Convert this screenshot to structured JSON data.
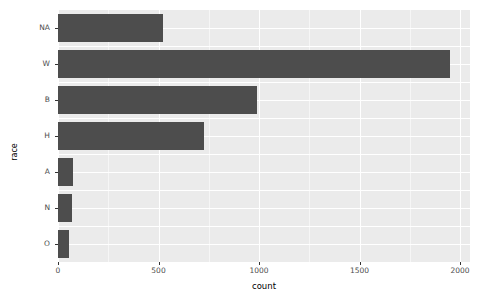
{
  "chart_data": {
    "type": "bar",
    "orientation": "horizontal",
    "title": "",
    "xlabel": "count",
    "ylabel": "race",
    "categories": [
      "NA",
      "W",
      "B",
      "H",
      "A",
      "N",
      "O"
    ],
    "values": [
      520,
      1950,
      990,
      727,
      75,
      70,
      55
    ],
    "xlim": [
      0,
      2050
    ],
    "x_ticks": [
      0,
      500,
      1000,
      1500,
      2000
    ],
    "x_tick_labels": [
      "0",
      "500",
      "1000",
      "1500",
      "2000"
    ],
    "x_minor_ticks": [
      250,
      750,
      1250,
      1750
    ],
    "grid": true,
    "legend": "none",
    "bar_color": "#4d4d4d",
    "panel_background": "#ebebeb",
    "grid_color": "#ffffff",
    "plot_background": "#ffffff"
  },
  "axes": {
    "y_title": "race",
    "x_title": "count"
  }
}
